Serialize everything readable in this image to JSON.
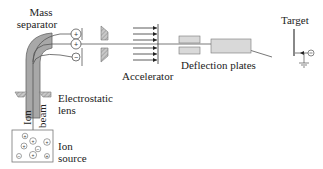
{
  "diagram": {
    "labels": {
      "mass_separator_line1": "Mass",
      "mass_separator_line2": "separator",
      "electrostatic_lens_line1": "Electrostatic",
      "electrostatic_lens_line2": "lens",
      "ion_beam_word1": "Ion",
      "ion_beam_word2": "beam",
      "ion_source_line1": "Ion",
      "ion_source_line2": "source",
      "accelerator": "Accelerator",
      "deflection_plates": "Deflection plates",
      "target": "Target"
    },
    "symbols": {
      "plus": "+",
      "minus": "−"
    },
    "colors": {
      "line": "#555555",
      "plate_fill": "#d9d9d9",
      "separator_fill": "#a8a8a8",
      "text": "#222222"
    }
  }
}
